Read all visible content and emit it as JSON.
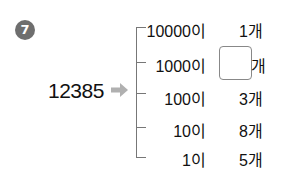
{
  "problem": {
    "number_badge": "7",
    "source_number": "12385",
    "arrow_icon": "right-arrow",
    "rows": [
      {
        "place": "10000이",
        "count": "1개",
        "blank": false
      },
      {
        "place": "1000이",
        "count": "개",
        "blank": true
      },
      {
        "place": "100이",
        "count": "3개",
        "blank": false
      },
      {
        "place": "10이",
        "count": "8개",
        "blank": false
      },
      {
        "place": "1이",
        "count": "5개",
        "blank": false
      }
    ]
  },
  "colors": {
    "badge": "#6e6e6e",
    "arrow": "#b0b0b0",
    "bracket": "#777777"
  }
}
